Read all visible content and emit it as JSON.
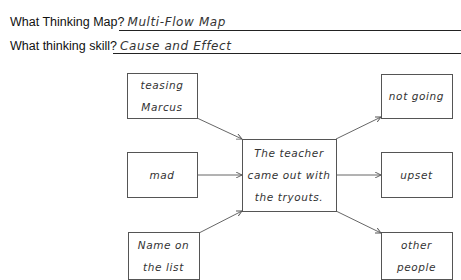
{
  "header": {
    "map_question": "What Thinking Map?",
    "map_answer": "Multi-Flow Map",
    "skill_question": "What thinking skill?",
    "skill_answer": "Cause and Effect"
  },
  "diagram": {
    "type": "multi-flow map",
    "event": {
      "lines": [
        "The teacher",
        "came out with",
        "the tryouts."
      ]
    },
    "causes": [
      {
        "lines": [
          "teasing",
          "Marcus"
        ]
      },
      {
        "lines": [
          "mad"
        ]
      },
      {
        "lines": [
          "Name on",
          "the list"
        ]
      }
    ],
    "effects": [
      {
        "lines": [
          "not going"
        ]
      },
      {
        "lines": [
          "upset"
        ]
      },
      {
        "lines": [
          "other",
          "people"
        ]
      }
    ],
    "stroke_color": "#555555",
    "text_color": "#333333"
  }
}
